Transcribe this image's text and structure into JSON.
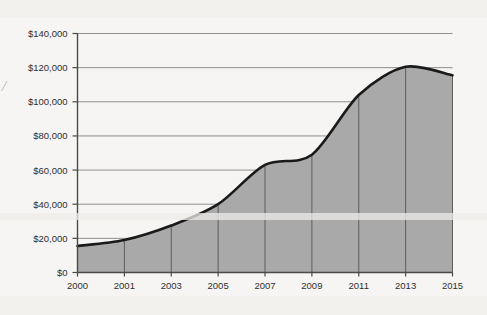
{
  "chart_data": {
    "type": "area",
    "title": "",
    "subtitle": "",
    "xlabel": "",
    "ylabel": "",
    "x": [
      2000,
      2001,
      2003,
      2005,
      2007,
      2009,
      2011,
      2013,
      2015
    ],
    "categories": [
      "2000",
      "2001",
      "2003",
      "2005",
      "2007",
      "2009",
      "2011",
      "2013",
      "2015"
    ],
    "values": [
      15500,
      19000,
      27500,
      40000,
      63000,
      69000,
      104000,
      120500,
      115500
    ],
    "series": [
      {
        "name": "",
        "values": [
          15500,
          19000,
          27500,
          40000,
          63000,
          69000,
          104000,
          120500,
          115500
        ]
      }
    ],
    "ylim": [
      0,
      140000
    ],
    "yticks": [
      0,
      20000,
      40000,
      60000,
      80000,
      100000,
      120000,
      140000
    ],
    "ytick_labels": [
      "$0",
      "$20,000",
      "$40,000",
      "$60,000",
      "$80,000",
      "$100,000",
      "$120,000",
      "$140,000"
    ],
    "xtick_labels": [
      "2000",
      "2001",
      "2003",
      "2005",
      "2007",
      "2009",
      "2011",
      "2013",
      "2015"
    ],
    "grid": true,
    "grid_axis": "y",
    "legend": false,
    "legend_position": "none",
    "annotations": [],
    "colors": {
      "area_fill": "#a9a9a9",
      "line": "#1a1a1a",
      "grid": "#8f8f8f",
      "axis": "#4a4a4a",
      "tick_label": "#2f2f2f",
      "background": "#f6f5f3",
      "dropline": "#5d5d5d"
    }
  },
  "artifacts": {
    "edge_mark": "/"
  }
}
